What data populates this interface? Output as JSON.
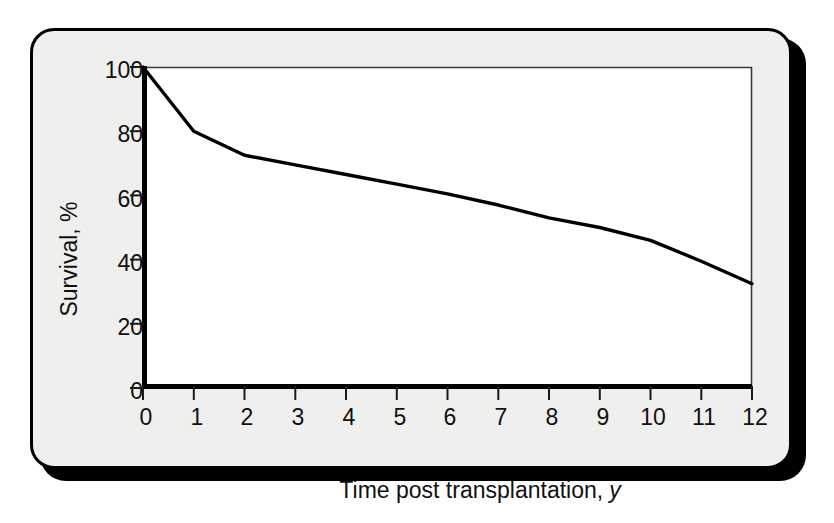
{
  "figure": {
    "background_color": "#efefed",
    "plot_background_color": "#ffffff",
    "border_color": "#000000",
    "line_color": "#000000"
  },
  "axes": {
    "y_title": "Survival, %",
    "x_title_main": "Time post transplantation,",
    "x_title_unit": "y",
    "y_ticks": [
      "0",
      "20",
      "40",
      "60",
      "80",
      "100"
    ],
    "x_ticks": [
      "0",
      "1",
      "2",
      "3",
      "4",
      "5",
      "6",
      "7",
      "8",
      "9",
      "10",
      "11",
      "12"
    ]
  },
  "chart_data": {
    "type": "line",
    "title": "",
    "subtitle": "",
    "xlabel": "Time post transplantation, y",
    "ylabel": "Survival, %",
    "xlim": [
      0,
      12
    ],
    "ylim": [
      0,
      100
    ],
    "grid": false,
    "legend": null,
    "x": [
      0,
      1,
      2,
      3,
      4,
      5,
      6,
      7,
      8,
      9,
      10,
      11,
      12
    ],
    "series": [
      {
        "name": "Survival",
        "values": [
          100,
          80,
          72.5,
          69.5,
          66.5,
          63.5,
          60.5,
          57,
          53,
          50,
          46,
          39.5,
          32.5
        ]
      }
    ],
    "annotations": []
  }
}
